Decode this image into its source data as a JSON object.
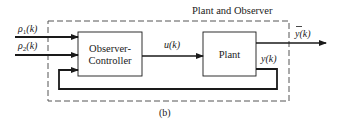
{
  "title": "Plant and Observer",
  "caption": "(b)",
  "blocks": {
    "observer_controller": {
      "line1": "Observer-",
      "line2": "Controller"
    },
    "plant": {
      "label": "Plant"
    }
  },
  "signals": {
    "input1": {
      "base": "ρ",
      "sub": "1",
      "arg": "(k)"
    },
    "input2": {
      "base": "ρ",
      "sub": "2",
      "arg": "(k)"
    },
    "control": "u(k)",
    "plant_output": "y(k)",
    "system_output": {
      "base": "y",
      "arg": "(k)"
    }
  },
  "colors": {
    "line": "#1a1a1a",
    "dashed": "#555555",
    "background": "#ffffff"
  }
}
